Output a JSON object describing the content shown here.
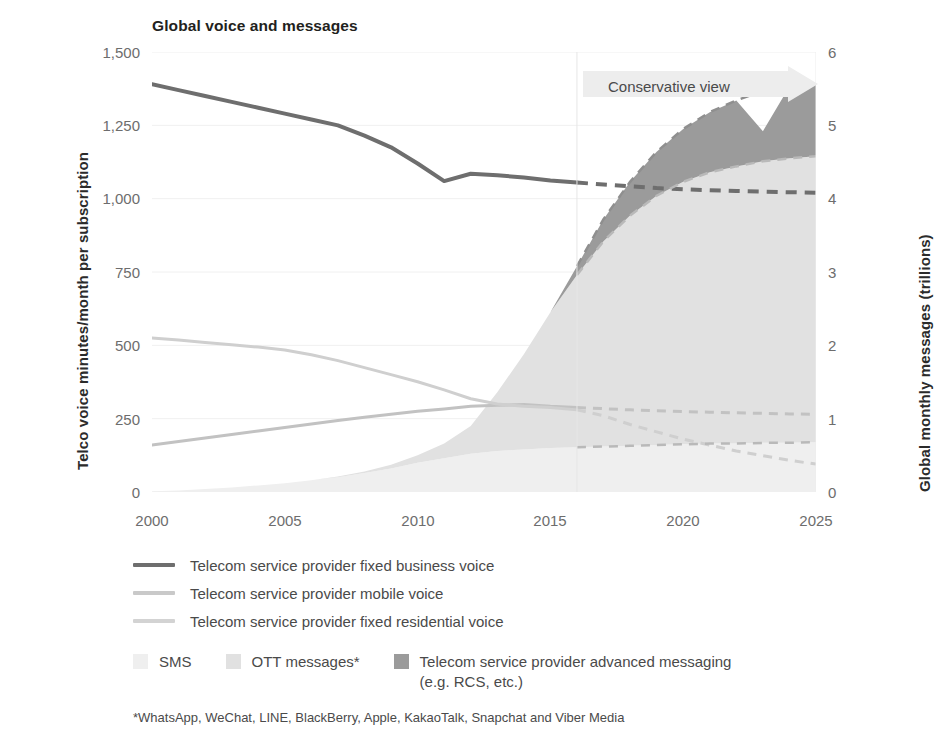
{
  "chart_data": {
    "type": "area",
    "title": "Global voice and messages",
    "xlabel": "",
    "ylabel": "Telco voice minutes/month per subscription",
    "ylabel_right": "Global monthly messages (trillions)",
    "grid": true,
    "legend_position": "bottom",
    "x": [
      2000,
      2001,
      2002,
      2003,
      2004,
      2005,
      2006,
      2007,
      2008,
      2009,
      2010,
      2011,
      2012,
      2013,
      2014,
      2015,
      2016,
      2017,
      2018,
      2019,
      2020,
      2021,
      2022,
      2023,
      2024,
      2025
    ],
    "xticks": [
      "2000",
      "2005",
      "2010",
      "2015",
      "2020",
      "2025"
    ],
    "xlim": [
      2000,
      2025
    ],
    "yticks_left": [
      "0",
      "250",
      "500",
      "750",
      "1,000",
      "1,250",
      "1,500"
    ],
    "ylim_left": [
      0,
      1500
    ],
    "yticks_right": [
      "0",
      "1",
      "2",
      "3",
      "4",
      "5",
      "6"
    ],
    "ylim_right": [
      0,
      6
    ],
    "forecast_start": 2016,
    "annotation": "Conservative view",
    "footnote": "*WhatsApp, WeChat, LINE, BlackBerry, Apple, KakaoTalk, Snapchat and Viber Media",
    "lines": [
      {
        "name": "Telecom service provider fixed business voice",
        "axis": "left",
        "color": "#6e6e6e",
        "values": [
          1390,
          1370,
          1350,
          1330,
          1310,
          1290,
          1270,
          1250,
          1215,
          1175,
          1120,
          1060,
          1085,
          1080,
          1072,
          1062,
          1055,
          1048,
          1042,
          1036,
          1032,
          1029,
          1026,
          1024,
          1022,
          1020
        ]
      },
      {
        "name": "Telecom service provider mobile voice",
        "axis": "left",
        "color": "#c2c2c2",
        "values": [
          160,
          172,
          184,
          196,
          208,
          220,
          232,
          244,
          255,
          265,
          275,
          283,
          292,
          296,
          298,
          292,
          288,
          284,
          280,
          277,
          274,
          272,
          270,
          268,
          266,
          265
        ]
      },
      {
        "name": "Telecom service provider fixed residential voice",
        "axis": "left",
        "color": "#cfcfcf",
        "values": [
          525,
          518,
          510,
          502,
          494,
          484,
          468,
          448,
          424,
          400,
          376,
          348,
          318,
          300,
          292,
          288,
          280,
          260,
          230,
          205,
          180,
          160,
          140,
          124,
          108,
          95
        ]
      }
    ],
    "areas": [
      {
        "name": "SMS",
        "axis": "right",
        "color": "#efefef",
        "values": [
          0.01,
          0.02,
          0.04,
          0.06,
          0.09,
          0.12,
          0.16,
          0.2,
          0.26,
          0.32,
          0.4,
          0.46,
          0.52,
          0.56,
          0.58,
          0.6,
          0.61,
          0.62,
          0.63,
          0.64,
          0.65,
          0.66,
          0.66,
          0.67,
          0.67,
          0.68
        ]
      },
      {
        "name": "OTT messages*",
        "axis": "right",
        "color": "#e1e1e1",
        "values": [
          0.0,
          0.0,
          0.0,
          0.0,
          0.0,
          0.0,
          0.0,
          0.01,
          0.02,
          0.05,
          0.1,
          0.2,
          0.38,
          0.8,
          1.3,
          1.85,
          2.35,
          2.8,
          3.14,
          3.4,
          3.58,
          3.7,
          3.78,
          3.84,
          3.88,
          3.9
        ]
      },
      {
        "name": "Telecom service provider advanced messaging (e.g. RCS, etc.)",
        "axis": "right",
        "color": "#9b9b9b",
        "values": [
          0.0,
          0.0,
          0.0,
          0.0,
          0.0,
          0.0,
          0.0,
          0.0,
          0.0,
          0.0,
          0.0,
          0.0,
          0.0,
          0.0,
          0.0,
          0.0,
          0.12,
          0.3,
          0.46,
          0.6,
          0.72,
          0.82,
          0.9,
          0.96,
          0.98,
          0.97
        ]
      }
    ]
  },
  "legend": {
    "lines": [
      {
        "label": "Telecom service provider fixed business voice",
        "color": "#6e6e6e"
      },
      {
        "label": "Telecom service provider mobile voice",
        "color": "#c9c9c9"
      },
      {
        "label": "Telecom service provider fixed residential voice",
        "color": "#d3d3d3"
      }
    ],
    "areas": [
      {
        "label": "SMS",
        "color": "#efefef"
      },
      {
        "label": "OTT messages*",
        "color": "#e1e1e1"
      },
      {
        "label": "Telecom service provider advanced messaging",
        "label2": "(e.g. RCS, etc.)",
        "color": "#9b9b9b"
      }
    ]
  },
  "colors": {
    "background": "#ffffff",
    "gridline": "#f0f0f0",
    "axis_text": "#6d6d6d",
    "title_text": "#231f20",
    "banner": "#ededed"
  }
}
